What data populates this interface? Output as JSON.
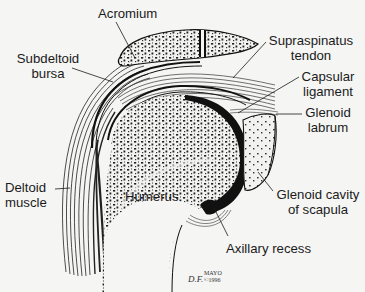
{
  "diagram": {
    "labels": {
      "acromium": "Acromium",
      "subdeltoid_bursa": [
        "Subdeltoid",
        "bursa"
      ],
      "supraspinatus_tendon": [
        "Supraspinatus",
        "tendon"
      ],
      "capsular_ligament": [
        "Capsular",
        "ligament"
      ],
      "glenoid_labrum": [
        "Glenoid",
        "labrum"
      ],
      "deltoid_muscle": [
        "Deltoid",
        "muscle"
      ],
      "humerus": "Humerus",
      "glenoid_cavity": [
        "Glenoid cavity",
        "of scapula"
      ],
      "axillary_recess": "Axillary recess"
    },
    "signature": {
      "initials": "D.F.",
      "name": "MAYO",
      "copyright": "©1996"
    },
    "colors": {
      "background": "#f5f5f4",
      "ink": "#1a1a1a",
      "bone_fill": "#f0f0ee"
    }
  }
}
